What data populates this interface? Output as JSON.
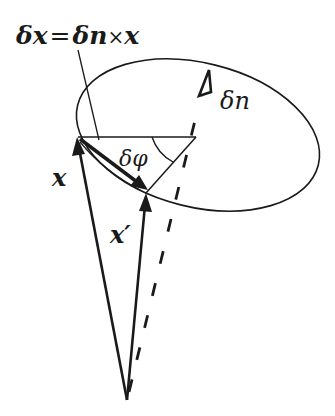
{
  "figure": {
    "labels": {
      "equation": "δx = δn×x",
      "delta_x": "δx",
      "equals": "=",
      "delta_n_cross": "δn",
      "times": "×",
      "x_after": "x",
      "delta_n": "δn",
      "delta_phi": "δφ",
      "x": "x",
      "x_prime": "x′"
    },
    "colors": {
      "stroke": "#1a1a1a",
      "background": "#ffffff"
    }
  }
}
